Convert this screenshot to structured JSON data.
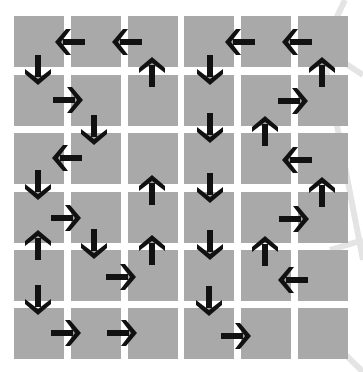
{
  "diagram": {
    "title": "",
    "grid": {
      "rows": 6,
      "cols": 6,
      "col_left": [
        14,
        71,
        128,
        184,
        241,
        298
      ],
      "row_top": [
        16,
        75,
        133,
        192,
        250,
        308
      ],
      "cell_width": 50,
      "cell_height": 51,
      "cell_color": "#a9a9a9",
      "background": "#ffffff"
    },
    "arrow_color": "#111111",
    "arrows": [
      {
        "x": 70,
        "y": 42,
        "dir": "left"
      },
      {
        "x": 127,
        "y": 42,
        "dir": "left"
      },
      {
        "x": 240,
        "y": 42,
        "dir": "left"
      },
      {
        "x": 297,
        "y": 42,
        "dir": "left"
      },
      {
        "x": 38,
        "y": 70,
        "dir": "down"
      },
      {
        "x": 152,
        "y": 72,
        "dir": "up"
      },
      {
        "x": 210,
        "y": 70,
        "dir": "down"
      },
      {
        "x": 322,
        "y": 72,
        "dir": "up"
      },
      {
        "x": 68,
        "y": 100,
        "dir": "right"
      },
      {
        "x": 293,
        "y": 101,
        "dir": "right"
      },
      {
        "x": 94,
        "y": 130,
        "dir": "down"
      },
      {
        "x": 210,
        "y": 128,
        "dir": "down"
      },
      {
        "x": 265,
        "y": 131,
        "dir": "up"
      },
      {
        "x": 67,
        "y": 158,
        "dir": "left"
      },
      {
        "x": 297,
        "y": 160,
        "dir": "left"
      },
      {
        "x": 38,
        "y": 185,
        "dir": "down"
      },
      {
        "x": 152,
        "y": 190,
        "dir": "up"
      },
      {
        "x": 210,
        "y": 188,
        "dir": "down"
      },
      {
        "x": 322,
        "y": 192,
        "dir": "up"
      },
      {
        "x": 66,
        "y": 218,
        "dir": "right"
      },
      {
        "x": 294,
        "y": 219,
        "dir": "right"
      },
      {
        "x": 38,
        "y": 245,
        "dir": "up"
      },
      {
        "x": 94,
        "y": 244,
        "dir": "down"
      },
      {
        "x": 152,
        "y": 250,
        "dir": "up"
      },
      {
        "x": 210,
        "y": 245,
        "dir": "down"
      },
      {
        "x": 265,
        "y": 251,
        "dir": "up"
      },
      {
        "x": 121,
        "y": 277,
        "dir": "right"
      },
      {
        "x": 293,
        "y": 280,
        "dir": "left"
      },
      {
        "x": 38,
        "y": 300,
        "dir": "down"
      },
      {
        "x": 209,
        "y": 301,
        "dir": "down"
      },
      {
        "x": 66,
        "y": 333,
        "dir": "right"
      },
      {
        "x": 122,
        "y": 333,
        "dir": "right"
      },
      {
        "x": 236,
        "y": 336,
        "dir": "right"
      }
    ]
  }
}
